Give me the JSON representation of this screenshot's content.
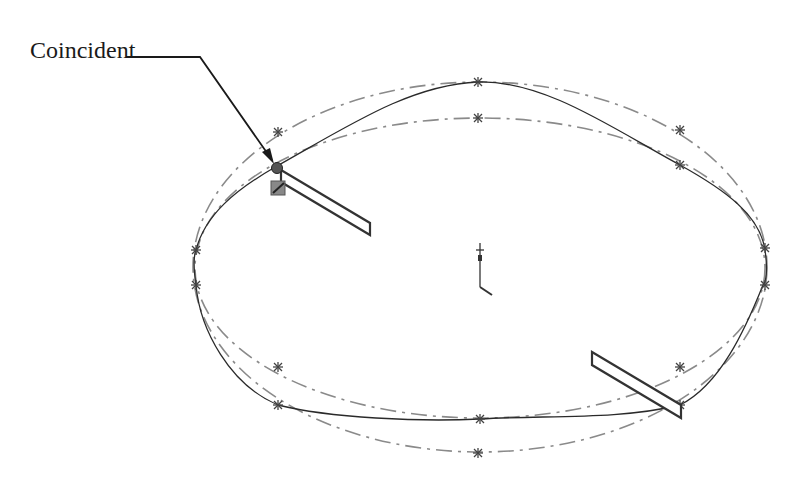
{
  "callout": {
    "label": "Coincident",
    "leader_start": [
      125,
      57
    ],
    "leader_bend": [
      200,
      57
    ],
    "arrow_tip": [
      274,
      163
    ]
  },
  "colors": {
    "construction_line": "#8a8a8a",
    "spline": "#2a2a2a",
    "handle_stroke": "#333333",
    "coincident_point": "#555555",
    "relation_glyph": "#888888"
  },
  "sketch": {
    "outer_construction_ellipse": {
      "cx": 480,
      "cy": 267,
      "rx": 287,
      "ry": 184
    },
    "inner_construction_ellipse": {
      "cx": 480,
      "cy": 268,
      "rx": 285,
      "ry": 150
    },
    "spline_points": [
      [
        277,
        166
      ],
      [
        478,
        82
      ],
      [
        680,
        165
      ],
      [
        765,
        248
      ],
      [
        763,
        285
      ],
      [
        680,
        405
      ],
      [
        480,
        419
      ],
      [
        278,
        405
      ],
      [
        196,
        285
      ],
      [
        196,
        250
      ]
    ],
    "star_markers": [
      [
        278,
        132
      ],
      [
        478,
        82
      ],
      [
        680,
        130
      ],
      [
        765,
        248
      ],
      [
        765,
        285
      ],
      [
        680,
        367
      ],
      [
        478,
        453
      ],
      [
        278,
        367
      ],
      [
        196,
        250
      ],
      [
        196,
        285
      ],
      [
        478,
        118
      ],
      [
        680,
        165
      ],
      [
        680,
        405
      ],
      [
        480,
        419
      ],
      [
        278,
        405
      ]
    ],
    "origin": {
      "x": 480,
      "y": 287
    },
    "handles": [
      {
        "name": "spline-handle-top-left",
        "points": "281,170 370,223 370,235 281,182"
      },
      {
        "name": "spline-handle-bottom-right",
        "points": "592,352 681,405 681,418 592,365"
      }
    ],
    "coincident_point": {
      "x": 277,
      "y": 168
    }
  }
}
